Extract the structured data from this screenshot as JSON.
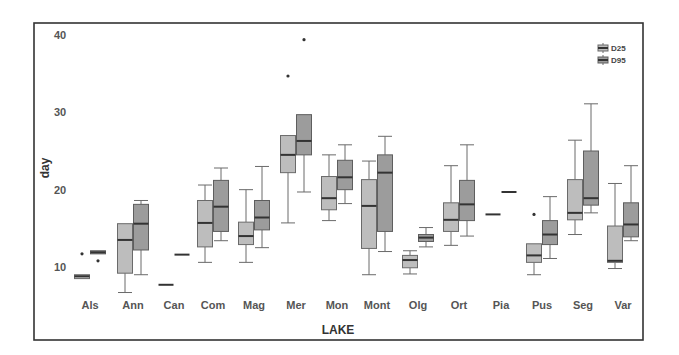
{
  "chart_data": {
    "type": "boxplot",
    "title": "",
    "xlabel": "LAKE",
    "ylabel": "day",
    "ylim": [
      5,
      41
    ],
    "yticks": [
      10,
      20,
      30,
      40
    ],
    "grid": false,
    "legend_position": "top-right",
    "categories": [
      "Als",
      "Ann",
      "Can",
      "Com",
      "Mag",
      "Mer",
      "Mon",
      "Mont",
      "Olg",
      "Ort",
      "Pia",
      "Pus",
      "Seg",
      "Var"
    ],
    "series": [
      {
        "name": "D25",
        "color": "#bdbdbd",
        "boxes": [
          {
            "whislo": 8.5,
            "q1": 8.5,
            "med": 8.8,
            "q3": 9.0,
            "whishi": 9.0,
            "fliers": [
              11.7
            ]
          },
          {
            "whislo": 6.7,
            "q1": 9.2,
            "med": 13.5,
            "q3": 15.6,
            "whishi": 15.6,
            "fliers": []
          },
          {
            "whislo": 7.7,
            "q1": 7.7,
            "med": 7.7,
            "q3": 7.7,
            "whishi": 7.7,
            "fliers": []
          },
          {
            "whislo": 10.6,
            "q1": 12.6,
            "med": 15.7,
            "q3": 18.6,
            "whishi": 20.6,
            "fliers": []
          },
          {
            "whislo": 10.6,
            "q1": 12.9,
            "med": 14.0,
            "q3": 15.8,
            "whishi": 20.0,
            "fliers": []
          },
          {
            "whislo": 15.7,
            "q1": 22.2,
            "med": 24.5,
            "q3": 27.0,
            "whishi": 27.0,
            "fliers": [
              34.7
            ]
          },
          {
            "whislo": 16.0,
            "q1": 17.4,
            "med": 18.9,
            "q3": 21.7,
            "whishi": 24.5,
            "fliers": []
          },
          {
            "whislo": 9.0,
            "q1": 12.4,
            "med": 17.9,
            "q3": 21.3,
            "whishi": 23.7,
            "fliers": []
          },
          {
            "whislo": 9.1,
            "q1": 9.9,
            "med": 10.9,
            "q3": 11.5,
            "whishi": 12.1,
            "fliers": []
          },
          {
            "whislo": 12.8,
            "q1": 14.6,
            "med": 16.1,
            "q3": 18.3,
            "whishi": 23.1,
            "fliers": []
          },
          {
            "whislo": 16.8,
            "q1": 16.8,
            "med": 16.8,
            "q3": 16.8,
            "whishi": 16.8,
            "fliers": []
          },
          {
            "whislo": 9.0,
            "q1": 10.6,
            "med": 11.5,
            "q3": 13.0,
            "whishi": 13.0,
            "fliers": [
              16.8
            ]
          },
          {
            "whislo": 14.2,
            "q1": 16.1,
            "med": 17.0,
            "q3": 21.3,
            "whishi": 26.4,
            "fliers": []
          },
          {
            "whislo": 9.8,
            "q1": 10.6,
            "med": 10.8,
            "q3": 15.3,
            "whishi": 20.8,
            "fliers": []
          }
        ]
      },
      {
        "name": "D95",
        "color": "#9c9c9c",
        "boxes": [
          {
            "whislo": 11.7,
            "q1": 11.7,
            "med": 11.9,
            "q3": 12.1,
            "whishi": 12.1,
            "fliers": [
              10.8
            ]
          },
          {
            "whislo": 9.0,
            "q1": 12.2,
            "med": 15.6,
            "q3": 18.1,
            "whishi": 18.6,
            "fliers": []
          },
          {
            "whislo": 11.6,
            "q1": 11.6,
            "med": 11.6,
            "q3": 11.6,
            "whishi": 11.6,
            "fliers": []
          },
          {
            "whislo": 13.4,
            "q1": 14.6,
            "med": 17.8,
            "q3": 21.2,
            "whishi": 22.8,
            "fliers": []
          },
          {
            "whislo": 12.5,
            "q1": 14.8,
            "med": 16.4,
            "q3": 18.6,
            "whishi": 23.0,
            "fliers": []
          },
          {
            "whislo": 19.7,
            "q1": 24.5,
            "med": 26.3,
            "q3": 29.7,
            "whishi": 29.7,
            "fliers": [
              39.4
            ]
          },
          {
            "whislo": 18.2,
            "q1": 20.0,
            "med": 21.6,
            "q3": 23.8,
            "whishi": 25.8,
            "fliers": []
          },
          {
            "whislo": 12.0,
            "q1": 14.6,
            "med": 22.2,
            "q3": 24.5,
            "whishi": 26.9,
            "fliers": []
          },
          {
            "whislo": 12.6,
            "q1": 13.3,
            "med": 13.8,
            "q3": 14.2,
            "whishi": 15.1,
            "fliers": []
          },
          {
            "whislo": 14.0,
            "q1": 16.0,
            "med": 18.1,
            "q3": 21.2,
            "whishi": 25.8,
            "fliers": []
          },
          {
            "whislo": 19.7,
            "q1": 19.7,
            "med": 19.7,
            "q3": 19.7,
            "whishi": 19.7,
            "fliers": []
          },
          {
            "whislo": 11.1,
            "q1": 12.9,
            "med": 14.2,
            "q3": 16.0,
            "whishi": 19.1,
            "fliers": []
          },
          {
            "whislo": 17.0,
            "q1": 18.0,
            "med": 18.9,
            "q3": 25.0,
            "whishi": 31.1,
            "fliers": []
          },
          {
            "whislo": 13.4,
            "q1": 13.9,
            "med": 15.5,
            "q3": 18.3,
            "whishi": 23.1,
            "fliers": []
          }
        ]
      }
    ],
    "legend": [
      "D25",
      "D95"
    ]
  }
}
